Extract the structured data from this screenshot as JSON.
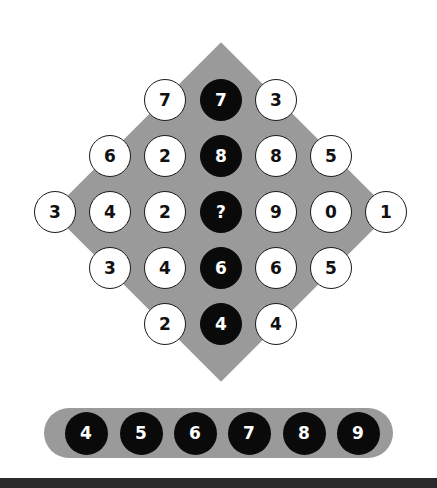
{
  "puzzle": {
    "colors": {
      "background": "#ffffff",
      "board": "#9a9a9a",
      "dark_circle": "#0a0a0a",
      "light_circle": "#ffffff"
    },
    "rows": [
      [
        {
          "value": "7",
          "style": "light"
        },
        {
          "value": "7",
          "style": "dark"
        },
        {
          "value": "3",
          "style": "light"
        }
      ],
      [
        {
          "value": "6",
          "style": "light"
        },
        {
          "value": "2",
          "style": "light"
        },
        {
          "value": "8",
          "style": "dark"
        },
        {
          "value": "8",
          "style": "light"
        },
        {
          "value": "5",
          "style": "light"
        }
      ],
      [
        {
          "value": "3",
          "style": "light"
        },
        {
          "value": "4",
          "style": "light"
        },
        {
          "value": "2",
          "style": "light"
        },
        {
          "value": "?",
          "style": "dark"
        },
        {
          "value": "9",
          "style": "light"
        },
        {
          "value": "0",
          "style": "light"
        },
        {
          "value": "1",
          "style": "light"
        }
      ],
      [
        {
          "value": "3",
          "style": "light"
        },
        {
          "value": "4",
          "style": "light"
        },
        {
          "value": "6",
          "style": "dark"
        },
        {
          "value": "6",
          "style": "light"
        },
        {
          "value": "5",
          "style": "light"
        }
      ],
      [
        {
          "value": "2",
          "style": "light"
        },
        {
          "value": "4",
          "style": "dark"
        },
        {
          "value": "4",
          "style": "light"
        }
      ]
    ]
  },
  "answers": {
    "options": [
      "4",
      "5",
      "6",
      "7",
      "8",
      "9"
    ]
  }
}
